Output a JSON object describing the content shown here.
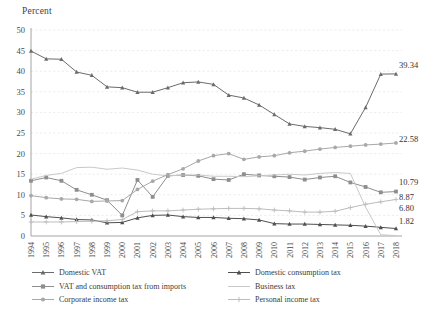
{
  "axis_title": "Percent",
  "chart_data": {
    "type": "line",
    "title": "",
    "subtitle": "",
    "xlabel": "",
    "ylabel": "Percent",
    "ylim": [
      0,
      50
    ],
    "ytick_step": 5,
    "yticks": [
      "0",
      "5",
      "10",
      "15",
      "20",
      "25",
      "30",
      "35",
      "40",
      "45",
      "50"
    ],
    "grid": true,
    "legend_position": "bottom",
    "categories": [
      "1994",
      "1995",
      "1996",
      "1997",
      "1998",
      "1999",
      "2000",
      "2001",
      "2002",
      "2003",
      "2004",
      "2005",
      "2006",
      "2007",
      "2008",
      "2009",
      "2010",
      "2011",
      "2012",
      "2013",
      "2014",
      "2015",
      "2016",
      "2017",
      "2018"
    ],
    "series": [
      {
        "name": "Domestic VAT",
        "color": "#6b6b6b",
        "marker": "triangle",
        "end_label": "39.34",
        "values": [
          44.9,
          43.0,
          42.9,
          39.8,
          39.0,
          36.2,
          36.0,
          34.9,
          34.9,
          36.0,
          37.2,
          37.4,
          36.8,
          34.2,
          33.5,
          31.8,
          29.5,
          27.2,
          26.6,
          26.3,
          25.9,
          24.8,
          31.2,
          39.3,
          39.34
        ]
      },
      {
        "name": "Domestic consumption tax",
        "color": "#4f4f4f",
        "marker": "triangle",
        "end_label": "1.82",
        "values": [
          5.1,
          4.7,
          4.4,
          4.0,
          3.9,
          3.2,
          3.3,
          4.4,
          5.0,
          5.1,
          4.7,
          4.5,
          4.5,
          4.3,
          4.2,
          3.9,
          3.0,
          2.9,
          2.9,
          2.8,
          2.7,
          2.6,
          2.4,
          2.1,
          1.82
        ]
      },
      {
        "name": "VAT and consumption tax from imports",
        "color": "#8e8e8e",
        "marker": "square",
        "end_label": "10.79",
        "values": [
          13.4,
          14.2,
          13.4,
          11.2,
          10.0,
          8.7,
          5.0,
          13.6,
          9.5,
          14.6,
          14.8,
          14.6,
          13.8,
          13.6,
          15.0,
          14.7,
          14.5,
          14.3,
          13.7,
          14.2,
          14.5,
          13.0,
          11.9,
          10.6,
          10.79
        ]
      },
      {
        "name": "Business tax",
        "color": "#c9c9c9",
        "marker": "none",
        "end_label": "",
        "values": [
          13.8,
          14.7,
          15.2,
          16.6,
          16.7,
          16.2,
          16.5,
          16.0,
          15.0,
          14.6,
          14.8,
          14.8,
          14.5,
          14.5,
          14.4,
          14.6,
          14.8,
          15.0,
          14.8,
          15.2,
          15.4,
          15.2,
          7.0,
          0.3,
          0.1
        ]
      },
      {
        "name": "Corporate income tax",
        "color": "#a8a8a8",
        "marker": "circle",
        "end_label": "22.58",
        "values": [
          9.8,
          9.3,
          9.0,
          8.9,
          8.4,
          8.5,
          8.6,
          11.3,
          13.3,
          14.9,
          16.3,
          18.2,
          19.5,
          20.0,
          18.6,
          19.2,
          19.5,
          20.2,
          20.6,
          21.1,
          21.5,
          21.8,
          22.1,
          22.3,
          22.58
        ]
      },
      {
        "name": "Personal income tax",
        "color": "#bdbdbd",
        "marker": "plus",
        "end_label": "8.87",
        "values": [
          3.4,
          3.4,
          3.4,
          3.5,
          3.6,
          3.7,
          4.0,
          5.9,
          6.1,
          6.1,
          6.3,
          6.5,
          6.6,
          6.7,
          6.7,
          6.6,
          6.3,
          6.1,
          5.8,
          5.8,
          6.0,
          6.9,
          7.7,
          8.3,
          8.87
        ]
      }
    ],
    "extra_end_labels": [
      {
        "text": "6.80",
        "series_hint": "second-from-bottom"
      }
    ],
    "end_labels_all": [
      "39.34",
      "22.58",
      "10.79",
      "8.87",
      "6.80",
      "1.82"
    ]
  },
  "legend": {
    "left_items": [
      {
        "label": "Domestic VAT",
        "color": "#6b6b6b",
        "marker": "triangle"
      },
      {
        "label": "VAT and consumption tax from imports",
        "color": "#8e8e8e",
        "marker": "square"
      },
      {
        "label": "Corporate income tax",
        "color": "#a8a8a8",
        "marker": "circle"
      }
    ],
    "right_items": [
      {
        "label": "Domestic consumption tax",
        "color": "#4f4f4f",
        "marker": "triangle"
      },
      {
        "label": "Business tax",
        "color": "#c9c9c9",
        "marker": "none"
      },
      {
        "label": "Personal income tax",
        "color": "#bdbdbd",
        "marker": "plus"
      }
    ]
  }
}
